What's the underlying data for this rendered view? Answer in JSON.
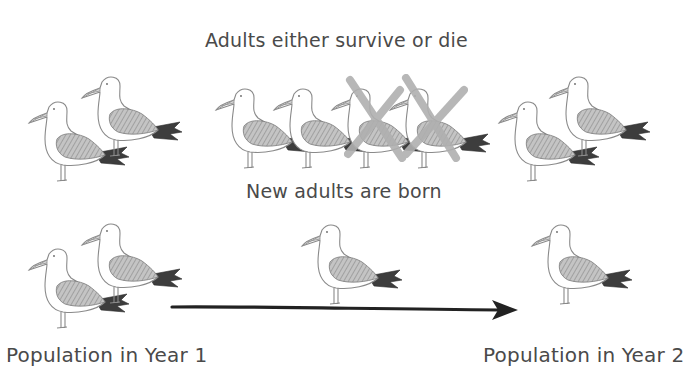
{
  "captions": {
    "survival": "Adults either survive or die",
    "recruitment": "New adults are born",
    "population_year1": "Population in Year 1",
    "population_year2": "Population in Year 2"
  },
  "rows": {
    "survival_row": {
      "left_group": {
        "birds": 2,
        "description": "Adults in Year 1"
      },
      "middle_group": {
        "birds": 4,
        "crossed_out": 2,
        "description": "Adults: 2 survive, 2 die"
      },
      "right_group": {
        "birds": 2,
        "description": "Surviving adults in Year 2"
      }
    },
    "recruitment_row": {
      "left_group": {
        "birds": 2
      },
      "middle_group": {
        "birds": 1,
        "description": "New adult born"
      },
      "right_group": {
        "birds": 1
      }
    }
  },
  "arrow": {
    "direction": "right",
    "from": "Population in Year 1",
    "to": "Population in Year 2"
  },
  "colors": {
    "outline": "#8a8a8a",
    "wing": "#a9a9a9",
    "tail": "#3d3d3d",
    "cross": "#b3b3b3",
    "arrow": "#222222",
    "text": "#4a4a4a"
  }
}
